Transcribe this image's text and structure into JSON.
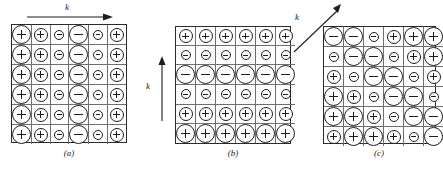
{
  "figure": {
    "type": "lattice-wave-diagram",
    "ion_symbols": {
      "positive": "+",
      "negative": "-"
    },
    "sizes": {
      "large": "lg",
      "medium": "md",
      "small": "sm"
    },
    "colors": {
      "ink": "#1d1d1d",
      "gridline": "#6f6f6f",
      "background": "#ffffff"
    }
  },
  "panels": [
    {
      "id": "a",
      "caption": "(a)",
      "wave_label": "k",
      "wave_direction": "horizontal-right",
      "grid": [
        [
          {
            "sign": "+",
            "size": "lg"
          },
          {
            "sign": "+",
            "size": "md"
          },
          {
            "sign": "-",
            "size": "sm"
          },
          {
            "sign": "-",
            "size": "lg"
          },
          {
            "sign": "-",
            "size": "sm"
          },
          {
            "sign": "+",
            "size": "md"
          }
        ],
        [
          {
            "sign": "+",
            "size": "lg"
          },
          {
            "sign": "+",
            "size": "md"
          },
          {
            "sign": "-",
            "size": "sm"
          },
          {
            "sign": "-",
            "size": "lg"
          },
          {
            "sign": "-",
            "size": "sm"
          },
          {
            "sign": "+",
            "size": "md"
          }
        ],
        [
          {
            "sign": "+",
            "size": "lg"
          },
          {
            "sign": "+",
            "size": "md"
          },
          {
            "sign": "-",
            "size": "sm"
          },
          {
            "sign": "-",
            "size": "lg"
          },
          {
            "sign": "-",
            "size": "sm"
          },
          {
            "sign": "+",
            "size": "md"
          }
        ],
        [
          {
            "sign": "+",
            "size": "lg"
          },
          {
            "sign": "+",
            "size": "md"
          },
          {
            "sign": "-",
            "size": "sm"
          },
          {
            "sign": "-",
            "size": "lg"
          },
          {
            "sign": "-",
            "size": "sm"
          },
          {
            "sign": "+",
            "size": "md"
          }
        ],
        [
          {
            "sign": "+",
            "size": "lg"
          },
          {
            "sign": "+",
            "size": "md"
          },
          {
            "sign": "-",
            "size": "sm"
          },
          {
            "sign": "-",
            "size": "lg"
          },
          {
            "sign": "-",
            "size": "sm"
          },
          {
            "sign": "+",
            "size": "md"
          }
        ],
        [
          {
            "sign": "+",
            "size": "lg"
          },
          {
            "sign": "+",
            "size": "md"
          },
          {
            "sign": "-",
            "size": "sm"
          },
          {
            "sign": "-",
            "size": "lg"
          },
          {
            "sign": "-",
            "size": "sm"
          },
          {
            "sign": "+",
            "size": "md"
          }
        ]
      ]
    },
    {
      "id": "b",
      "caption": "(b)",
      "wave_label": "k",
      "wave_direction": "vertical-up",
      "grid": [
        [
          {
            "sign": "+",
            "size": "md"
          },
          {
            "sign": "+",
            "size": "md"
          },
          {
            "sign": "+",
            "size": "md"
          },
          {
            "sign": "+",
            "size": "md"
          },
          {
            "sign": "+",
            "size": "md"
          },
          {
            "sign": "+",
            "size": "md"
          }
        ],
        [
          {
            "sign": "-",
            "size": "sm"
          },
          {
            "sign": "-",
            "size": "sm"
          },
          {
            "sign": "-",
            "size": "sm"
          },
          {
            "sign": "-",
            "size": "sm"
          },
          {
            "sign": "-",
            "size": "sm"
          },
          {
            "sign": "-",
            "size": "sm"
          }
        ],
        [
          {
            "sign": "-",
            "size": "lg"
          },
          {
            "sign": "-",
            "size": "lg"
          },
          {
            "sign": "-",
            "size": "lg"
          },
          {
            "sign": "-",
            "size": "lg"
          },
          {
            "sign": "-",
            "size": "lg"
          },
          {
            "sign": "-",
            "size": "lg"
          }
        ],
        [
          {
            "sign": "-",
            "size": "sm"
          },
          {
            "sign": "-",
            "size": "sm"
          },
          {
            "sign": "-",
            "size": "sm"
          },
          {
            "sign": "-",
            "size": "sm"
          },
          {
            "sign": "-",
            "size": "sm"
          },
          {
            "sign": "-",
            "size": "sm"
          }
        ],
        [
          {
            "sign": "+",
            "size": "md"
          },
          {
            "sign": "+",
            "size": "md"
          },
          {
            "sign": "+",
            "size": "md"
          },
          {
            "sign": "+",
            "size": "md"
          },
          {
            "sign": "+",
            "size": "md"
          },
          {
            "sign": "+",
            "size": "md"
          }
        ],
        [
          {
            "sign": "+",
            "size": "lg"
          },
          {
            "sign": "+",
            "size": "lg"
          },
          {
            "sign": "+",
            "size": "lg"
          },
          {
            "sign": "+",
            "size": "lg"
          },
          {
            "sign": "+",
            "size": "lg"
          },
          {
            "sign": "+",
            "size": "lg"
          }
        ]
      ]
    },
    {
      "id": "c",
      "caption": "(c)",
      "wave_label": "k",
      "wave_direction": "diagonal-up-right",
      "grid": [
        [
          {
            "sign": "-",
            "size": "lg"
          },
          {
            "sign": "-",
            "size": "lg"
          },
          {
            "sign": "-",
            "size": "sm"
          },
          {
            "sign": "+",
            "size": "md"
          },
          {
            "sign": "+",
            "size": "lg"
          },
          {
            "sign": "+",
            "size": "lg"
          }
        ],
        [
          {
            "sign": "-",
            "size": "sm"
          },
          {
            "sign": "-",
            "size": "lg"
          },
          {
            "sign": "-",
            "size": "lg"
          },
          {
            "sign": "-",
            "size": "sm"
          },
          {
            "sign": "+",
            "size": "md"
          },
          {
            "sign": "+",
            "size": "lg"
          }
        ],
        [
          {
            "sign": "+",
            "size": "md"
          },
          {
            "sign": "-",
            "size": "sm"
          },
          {
            "sign": "-",
            "size": "lg"
          },
          {
            "sign": "-",
            "size": "lg"
          },
          {
            "sign": "-",
            "size": "sm"
          },
          {
            "sign": "+",
            "size": "md"
          }
        ],
        [
          {
            "sign": "+",
            "size": "lg"
          },
          {
            "sign": "+",
            "size": "md"
          },
          {
            "sign": "-",
            "size": "sm"
          },
          {
            "sign": "-",
            "size": "lg"
          },
          {
            "sign": "-",
            "size": "lg"
          },
          {
            "sign": "-",
            "size": "sm"
          }
        ],
        [
          {
            "sign": "+",
            "size": "lg"
          },
          {
            "sign": "+",
            "size": "lg"
          },
          {
            "sign": "+",
            "size": "md"
          },
          {
            "sign": "-",
            "size": "sm"
          },
          {
            "sign": "-",
            "size": "lg"
          },
          {
            "sign": "-",
            "size": "lg"
          }
        ],
        [
          {
            "sign": "+",
            "size": "md"
          },
          {
            "sign": "+",
            "size": "lg"
          },
          {
            "sign": "+",
            "size": "lg"
          },
          {
            "sign": "+",
            "size": "md"
          },
          {
            "sign": "-",
            "size": "sm"
          },
          {
            "sign": "-",
            "size": "lg"
          }
        ]
      ]
    }
  ]
}
